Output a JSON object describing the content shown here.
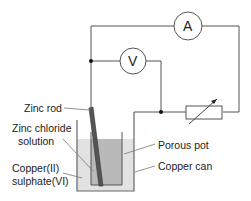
{
  "diagram": {
    "meters": {
      "ammeter": {
        "symbol": "A"
      },
      "voltmeter": {
        "symbol": "V"
      }
    },
    "components": [
      "ammeter",
      "voltmeter",
      "variable-resistor",
      "zinc-rod",
      "porous-pot",
      "copper-can"
    ],
    "labels": {
      "zinc_rod": "Zinc rod",
      "zinc_chloride_1": "Zinc chloride",
      "zinc_chloride_2": "solution",
      "porous_pot": "Porous pot",
      "copper_can": "Copper can",
      "copper_sulphate_1": "Copper(II)",
      "copper_sulphate_2": "sulphate(VI)"
    },
    "colors": {
      "wire": "#555555",
      "outer_liquid": "#e0e0e0",
      "inner_liquid": "#b8b8b8",
      "rod": "#444444"
    }
  }
}
